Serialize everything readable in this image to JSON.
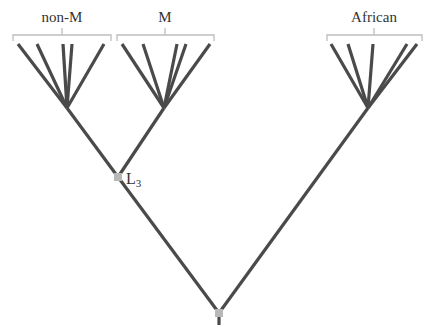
{
  "diagram": {
    "type": "phylogenetic-tree",
    "groups": [
      {
        "id": "non-M",
        "label": "non-M",
        "label_x": 62,
        "bracket": {
          "x1": 13,
          "x2": 111,
          "y": 35,
          "tick_y": 41,
          "mid_tick_top": 28
        },
        "hub": {
          "x": 67,
          "y": 108
        },
        "leaves_x": [
          18,
          37,
          63,
          72,
          104
        ]
      },
      {
        "id": "M",
        "label": "M",
        "label_x": 165,
        "bracket": {
          "x1": 117,
          "x2": 214,
          "y": 35,
          "tick_y": 41,
          "mid_tick_top": 28
        },
        "hub": {
          "x": 164,
          "y": 108
        },
        "leaves_x": [
          122,
          143,
          177,
          186,
          210
        ]
      },
      {
        "id": "African",
        "label": "African",
        "label_x": 374,
        "bracket": {
          "x1": 327,
          "x2": 422,
          "y": 35,
          "tick_y": 41,
          "mid_tick_top": 28
        },
        "hub": {
          "x": 368,
          "y": 108
        },
        "leaves_x": [
          331,
          348,
          373,
          407,
          417
        ]
      }
    ],
    "leaf_top_y": 44,
    "nodes": [
      {
        "id": "L3",
        "label_main": "L",
        "label_sub": "3",
        "x": 118,
        "y": 177
      },
      {
        "id": "root",
        "label_main": "",
        "label_sub": "",
        "x": 219,
        "y": 313
      }
    ],
    "root_stem_bottom_y": 325,
    "colors": {
      "branch": "#4a4a4a",
      "bracket": "#bdbdbd",
      "node": "#b8b8b8",
      "text": "#333333"
    }
  }
}
